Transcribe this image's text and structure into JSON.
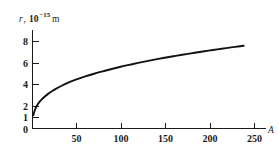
{
  "figure": {
    "background_color": "#ffffff",
    "curve_color": "#111111",
    "axis_color": "#1a1a1a"
  },
  "yaxis": {
    "variable": "r",
    "separator": ", ",
    "mantissa": "10",
    "exponent": "−15",
    "unit": "m",
    "full_label": "r, 10−15 m"
  },
  "xaxis": {
    "label": "A"
  },
  "chart_data": {
    "type": "line",
    "title": "",
    "subtitle": "",
    "xlabel": "A",
    "ylabel": "r, 10^-15 m",
    "xlim": [
      0,
      262
    ],
    "ylim": [
      0,
      8.9
    ],
    "grid": false,
    "legend": null,
    "xticks": [
      50,
      100,
      150,
      200,
      250
    ],
    "xtick_labels": [
      "50",
      "100",
      "150",
      "200",
      "250"
    ],
    "yticks": [
      0,
      1,
      2,
      4,
      6,
      8
    ],
    "ytick_labels": [
      "0",
      "1",
      "2",
      "4",
      "6",
      "8"
    ],
    "series": [
      {
        "name": "nuclear radius",
        "relation": "r = r0 * A^(1/3), r0 = 1.21",
        "x": [
          1,
          2,
          4,
          6,
          8,
          10,
          14,
          18,
          22,
          27,
          32,
          40,
          50,
          60,
          70,
          80,
          90,
          100,
          110,
          120,
          130,
          140,
          150,
          160,
          170,
          180,
          190,
          200,
          210,
          220,
          230,
          240
        ],
        "y": [
          1.21,
          1.52,
          1.92,
          2.2,
          2.42,
          2.61,
          2.91,
          3.17,
          3.39,
          3.63,
          3.84,
          4.14,
          4.46,
          4.74,
          4.98,
          5.2,
          5.41,
          5.61,
          5.79,
          5.96,
          6.12,
          6.28,
          6.43,
          6.57,
          6.7,
          6.83,
          6.96,
          7.08,
          7.19,
          7.31,
          7.42,
          7.52
        ]
      }
    ]
  }
}
